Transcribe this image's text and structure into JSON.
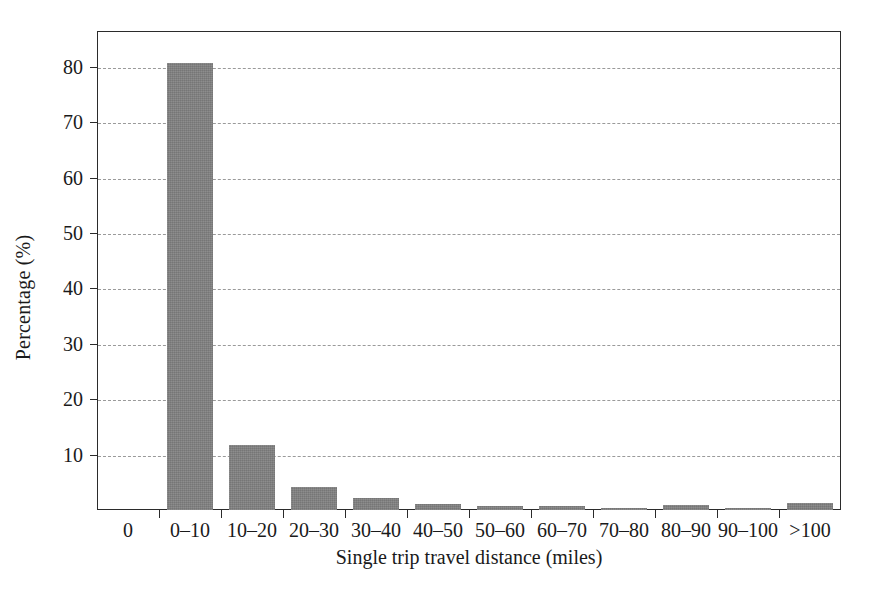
{
  "chart_data": {
    "type": "bar",
    "title": "",
    "subtitle": "",
    "xlabel": "Single trip travel distance (miles)",
    "ylabel": "Percentage (%)",
    "categories": [
      "0–10",
      "10–20",
      "20–30",
      "30–40",
      "40–50",
      "50–60",
      "60–70",
      "70–80",
      "80–90",
      "90–100",
      ">100"
    ],
    "values": [
      80.8,
      11.8,
      4.1,
      2.2,
      1.1,
      0.8,
      0.7,
      0.3,
      0.9,
      0.4,
      1.2
    ],
    "xlim_labels": [
      "0",
      "0–10",
      "10–20",
      "20–30",
      "30–40",
      "40–50",
      "50–60",
      "60–70",
      "70–80",
      "80–90",
      "90–100",
      ">100"
    ],
    "ylim": [
      0,
      86.5
    ],
    "yticks": [
      10,
      20,
      30,
      40,
      50,
      60,
      70,
      80
    ],
    "ytick_labels": [
      "10",
      "20",
      "30",
      "40",
      "50",
      "60",
      "70",
      "80"
    ],
    "grid": "horizontal-dashed",
    "legend": "none",
    "bar_color": "#808080",
    "grid_color": "#9a9a9a",
    "axis_color": "#2b2b2b",
    "origin_label": "0"
  }
}
